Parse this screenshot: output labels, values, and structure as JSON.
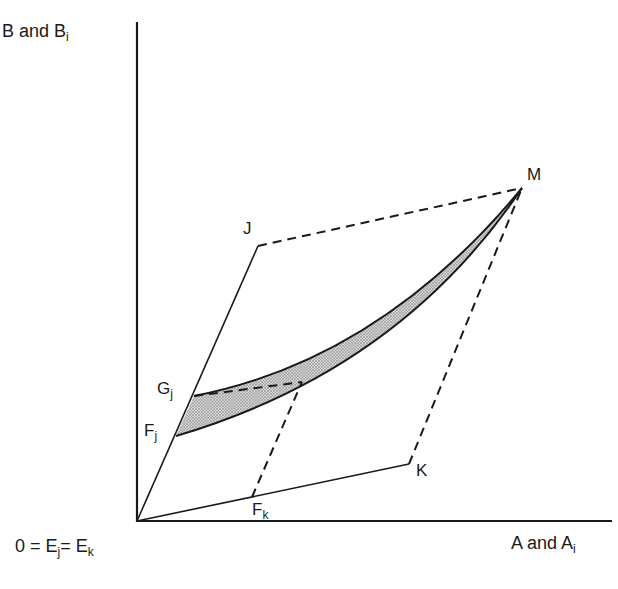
{
  "diagram": {
    "axes": {
      "y_label": {
        "main": "B and B",
        "sub": "i"
      },
      "x_label": {
        "main": "A and A",
        "sub": "i"
      },
      "origin_label": {
        "parts": [
          "0 = E",
          "j",
          "= E",
          "k"
        ]
      }
    },
    "points": {
      "J": {
        "label": "J"
      },
      "M": {
        "label": "M"
      },
      "K": {
        "label": "K"
      },
      "Gj": {
        "main": "G",
        "sub": "j"
      },
      "Fj": {
        "main": "F",
        "sub": "j"
      },
      "Fk": {
        "main": "F",
        "sub": "k"
      }
    },
    "colors": {
      "ink": "#1a1a1a",
      "shade": "#b8b8b8",
      "background": "#ffffff"
    }
  }
}
